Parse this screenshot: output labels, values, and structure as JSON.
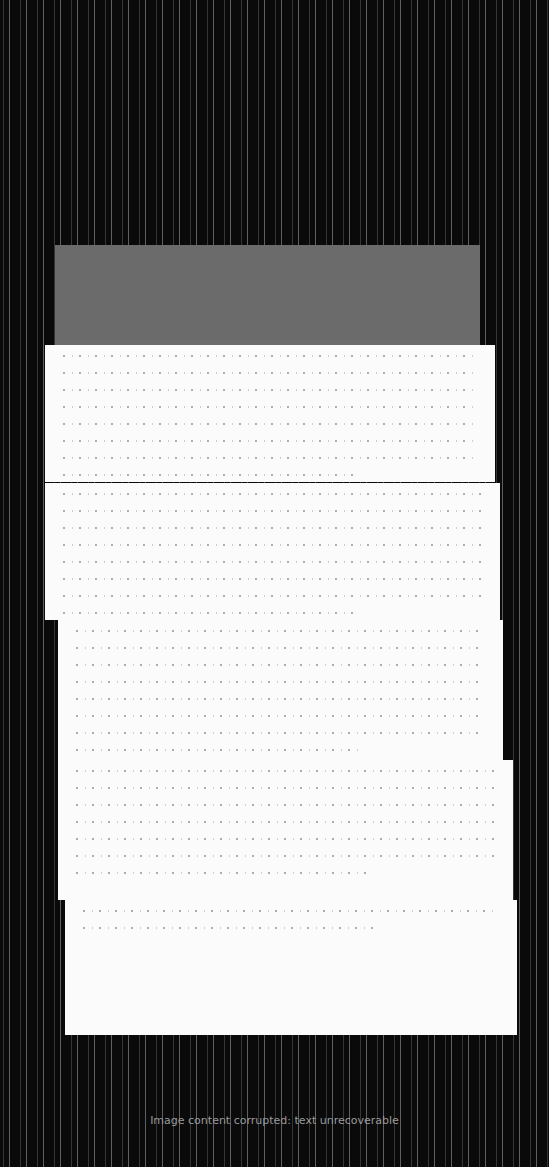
{
  "document": {
    "title": "",
    "subtitle": "",
    "status": "Image content corrupted: text unrecoverable",
    "panels": [
      {
        "id": "panel-1",
        "top": 345,
        "left": 45,
        "width": 450,
        "height": 137,
        "lines": 8
      },
      {
        "id": "panel-2",
        "top": 483,
        "left": 45,
        "width": 455,
        "height": 137,
        "lines": 8
      },
      {
        "id": "panel-3",
        "top": 620,
        "left": 58,
        "width": 445,
        "height": 140,
        "lines": 8
      },
      {
        "id": "panel-4",
        "top": 760,
        "left": 58,
        "width": 455,
        "height": 140,
        "lines": 7
      },
      {
        "id": "panel-5",
        "top": 900,
        "left": 65,
        "width": 452,
        "height": 135,
        "lines": 2
      }
    ],
    "visible_fragments": [
      "Ch",
      "dg",
      "pe",
      "be"
    ]
  },
  "colors": {
    "background": "#0a0a0a",
    "panel": "#fbfbfb",
    "header_band": "#6b6b6b"
  }
}
